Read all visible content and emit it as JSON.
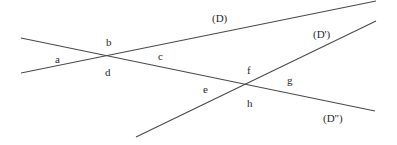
{
  "diagram": {
    "lines": [
      {
        "id": "D",
        "label": "(D)",
        "x1": 21,
        "y1": 73,
        "x2": 376,
        "y2": 1,
        "label_x": 212,
        "label_y": 22
      },
      {
        "id": "D-prime",
        "label": "(D')",
        "x1": 136,
        "y1": 137,
        "x2": 376,
        "y2": 21,
        "label_x": 313,
        "label_y": 38
      },
      {
        "id": "D-double-prime",
        "label": "(D\")",
        "x1": 21,
        "y1": 38,
        "x2": 375,
        "y2": 111,
        "label_x": 323,
        "label_y": 122
      }
    ],
    "angle_labels": [
      {
        "id": "a",
        "text": "a",
        "x": 55,
        "y": 63
      },
      {
        "id": "b",
        "text": "b",
        "x": 106,
        "y": 46
      },
      {
        "id": "c",
        "text": "c",
        "x": 158,
        "y": 60
      },
      {
        "id": "d",
        "text": "d",
        "x": 105,
        "y": 76
      },
      {
        "id": "e",
        "text": "e",
        "x": 203,
        "y": 93
      },
      {
        "id": "f",
        "text": "f",
        "x": 247,
        "y": 74
      },
      {
        "id": "g",
        "text": "g",
        "x": 287,
        "y": 84
      },
      {
        "id": "h",
        "text": "h",
        "x": 247,
        "y": 107
      }
    ],
    "colors": {
      "line": "#4a4a4a",
      "text": "#2a2a2a",
      "background": "#ffffff"
    }
  }
}
